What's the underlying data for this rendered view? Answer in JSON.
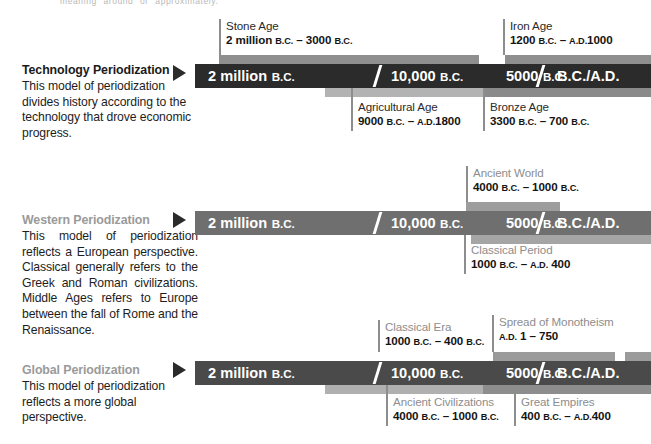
{
  "page": {
    "crop_note": "meaning \"around\" or \"approximately.\""
  },
  "scale_labels": [
    {
      "big": "2 million",
      "sm": "B.C."
    },
    {
      "big": "10,000",
      "sm": "B.C."
    },
    {
      "big": "5000",
      "sm": "B.C."
    },
    {
      "big": "B.C./A.D.",
      "sm": ""
    }
  ],
  "sections": [
    {
      "id": "technology",
      "title": "Technology Periodization",
      "title_dim": false,
      "body": "This model of periodization divides history according to the technology that drove economic progress.",
      "arrow_icon": "right-triangle-icon",
      "bar": {
        "base_color": "#2b2b2b",
        "band_color": "#8f8f8f",
        "tail_color": "#7d7d7d"
      },
      "callouts_above": [
        {
          "name": "stone-age",
          "label": "Stone Age",
          "range_pre": "2 million",
          "range_sc1": "B.C.",
          "dash": " – ",
          "range_mid": "3000",
          "range_sc2": "B.C.",
          "label_dark": true
        },
        {
          "name": "iron-age",
          "label": "Iron Age",
          "range_pre": "1200",
          "range_sc1": "B.C.",
          "dash": " – ",
          "range_sc2": "A.D.",
          "range_mid": "1000",
          "label_dark": true
        }
      ],
      "callouts_below": [
        {
          "name": "agricultural-age",
          "label": "Agricultural Age",
          "range_pre": "9000",
          "range_sc1": "B.C.",
          "dash": " – ",
          "range_sc2": "A.D.",
          "range_mid": "1800",
          "label_dark": true
        },
        {
          "name": "bronze-age",
          "label": "Bronze Age",
          "range_pre": "3300",
          "range_sc1": "B.C.",
          "dash": " – ",
          "range_mid": "700",
          "range_sc2": "B.C.",
          "label_dark": true
        }
      ]
    },
    {
      "id": "western",
      "title": "Western Periodization",
      "title_dim": true,
      "body": "This model of periodization reflects a European perspective. Classical generally refers to the Greek and Roman civilizations. Middle Ages refers to Europe between the fall of Rome and the Renaissance.",
      "arrow_icon": "right-triangle-icon",
      "bar": {
        "base_color": "#6f6f6f",
        "band_color": "#9d9d9d",
        "tail_color": "#8a8a8a"
      },
      "callouts_above": [
        {
          "name": "ancient-world",
          "label": "Ancient World",
          "range_pre": "4000",
          "range_sc1": "B.C.",
          "dash": " – ",
          "range_mid": "1000",
          "range_sc2": "B.C.",
          "label_dark": false
        }
      ],
      "callouts_below": [
        {
          "name": "classical-period",
          "label": "Classical Period",
          "range_pre": "1000",
          "range_sc1": "B.C.",
          "dash": " – ",
          "range_sc2": "A.D.",
          "range_mid": " 400",
          "label_dark": false
        }
      ]
    },
    {
      "id": "global",
      "title": "Global Periodization",
      "title_dim": true,
      "body": "This model of periodization reflects a more global perspective.",
      "arrow_icon": "right-triangle-icon",
      "bar": {
        "base_color": "#4a4a4a",
        "band_color": "#9b9b9b",
        "tail_color": "#8a8a8a"
      },
      "callouts_above": [
        {
          "name": "classical-era",
          "label": "Classical Era",
          "range_pre": "1000",
          "range_sc1": "B.C.",
          "dash": " – ",
          "range_mid": "400",
          "range_sc2": "B.C.",
          "label_dark": false
        },
        {
          "name": "spread-of-monotheism",
          "label": "Spread of Monotheism",
          "range_sc1": "A.D.",
          "range_pre": " 1",
          "dash": " – ",
          "range_mid": "750",
          "range_sc2": "",
          "label_dark": false
        }
      ],
      "callouts_below": [
        {
          "name": "ancient-civilizations",
          "label": "Ancient Civilizations",
          "range_pre": "4000",
          "range_sc1": "B.C.",
          "dash": " – ",
          "range_mid": "1000",
          "range_sc2": "B.C.",
          "label_dark": false
        },
        {
          "name": "great-empires",
          "label": "Great Empires",
          "range_pre": "400",
          "range_sc1": "B.C.",
          "dash": " – ",
          "range_sc2": "A.D.",
          "range_mid": "400",
          "label_dark": false
        }
      ]
    }
  ]
}
